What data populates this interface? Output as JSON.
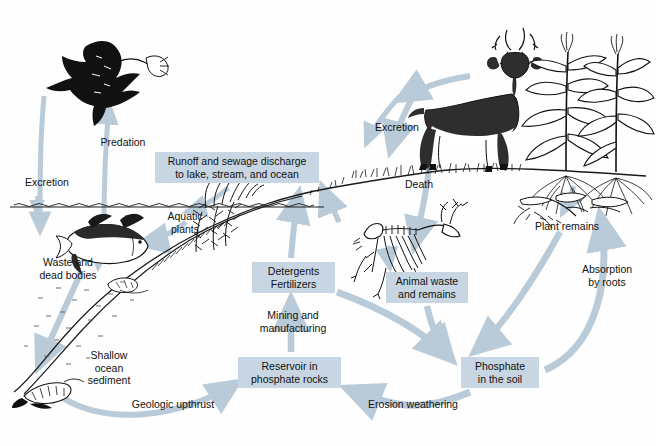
{
  "diagram": {
    "colors": {
      "box_fill": "#c7d6e2",
      "arrow": "#b9cbd8",
      "ink": "#111111",
      "background": "#ffffff"
    }
  },
  "boxes": [
    {
      "id": "runoff",
      "text": "Runoff and sewage discharge\nto lake, stream, and ocean",
      "x": 155,
      "y": 152,
      "w": 164,
      "h": 31
    },
    {
      "id": "detergents",
      "text": "Detergents\nFertilizers",
      "x": 252,
      "y": 262,
      "w": 83,
      "h": 31
    },
    {
      "id": "reservoir",
      "text": "Reservoir in\nphosphate rocks",
      "x": 238,
      "y": 357,
      "w": 103,
      "h": 31
    },
    {
      "id": "animalwaste",
      "text": "Animal waste\nand remains",
      "x": 386,
      "y": 272,
      "w": 82,
      "h": 31
    },
    {
      "id": "phosphate",
      "text": "Phosphate\nin the soil",
      "x": 461,
      "y": 357,
      "w": 78,
      "h": 31
    }
  ],
  "labels": [
    {
      "id": "predation",
      "text": "Predation",
      "x": 88,
      "y": 136,
      "w": 70
    },
    {
      "id": "excretion-left",
      "text": "Excretion",
      "x": 14,
      "y": 176,
      "w": 66
    },
    {
      "id": "aquatic-plants",
      "text": "Aquatic\nplants",
      "x": 157,
      "y": 210,
      "w": 56
    },
    {
      "id": "waste-dead",
      "text": "Waste and\ndead bodies",
      "x": 30,
      "y": 256,
      "w": 76
    },
    {
      "id": "shallow-sediment",
      "text": "Shallow\nocean\nsediment",
      "x": 78,
      "y": 349,
      "w": 62
    },
    {
      "id": "geologic-upthrust",
      "text": "Geologic upthrust",
      "x": 121,
      "y": 398,
      "w": 104
    },
    {
      "id": "mining",
      "text": "Mining and\nmanufacturing",
      "x": 246,
      "y": 309,
      "w": 94
    },
    {
      "id": "erosion",
      "text": "Erosion weathering",
      "x": 358,
      "y": 398,
      "w": 110
    },
    {
      "id": "excretion-right",
      "text": "Excretion",
      "x": 364,
      "y": 121,
      "w": 66
    },
    {
      "id": "death",
      "text": "Death",
      "x": 394,
      "y": 178,
      "w": 50
    },
    {
      "id": "plant-remains",
      "text": "Plant remains",
      "x": 524,
      "y": 220,
      "w": 86
    },
    {
      "id": "absorption",
      "text": "Absorption\nby roots",
      "x": 571,
      "y": 263,
      "w": 72
    }
  ],
  "illustrations": [
    {
      "id": "bird",
      "name": "flying-bird-with-fish"
    },
    {
      "id": "fish",
      "name": "fish"
    },
    {
      "id": "aquatic-plants",
      "name": "aquatic-plants"
    },
    {
      "id": "sediment",
      "name": "ocean-sediment-fossil"
    },
    {
      "id": "deer",
      "name": "deer"
    },
    {
      "id": "skeleton",
      "name": "deer-skeleton"
    },
    {
      "id": "corn",
      "name": "corn-plants"
    },
    {
      "id": "plant-remains",
      "name": "fallen-plant-debris"
    },
    {
      "id": "water-surface",
      "name": "water-surface-line"
    },
    {
      "id": "ground",
      "name": "ground-terrain-line"
    }
  ]
}
